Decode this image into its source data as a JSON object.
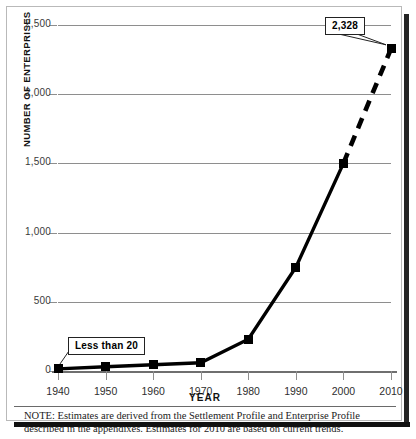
{
  "chart_data": {
    "type": "line",
    "title": "",
    "xlabel": "YEAR",
    "ylabel": "NUMBER OF ENTERPRISES",
    "x": [
      1940,
      1950,
      1960,
      1970,
      1980,
      1990,
      2000,
      2010
    ],
    "xticklabels": [
      "1940",
      "1950",
      "1960",
      "1970",
      "1980",
      "1990",
      "2000",
      "2010"
    ],
    "values": [
      15,
      30,
      45,
      60,
      230,
      750,
      1500,
      2328
    ],
    "yticks": [
      0,
      500,
      1000,
      1500,
      2000,
      2500
    ],
    "yticklabels": [
      "0",
      "500",
      "1,000",
      "1,500",
      "2,000",
      "2,500"
    ],
    "ylim": [
      0,
      2500
    ],
    "xlim": [
      1940,
      2010
    ],
    "grid": true,
    "legend": false,
    "series": [
      {
        "name": "Number of enterprises",
        "values": [
          15,
          30,
          45,
          60,
          230,
          750,
          1500,
          2328
        ],
        "solid_through": 2000,
        "dashed_from": 2000,
        "color": "#000000",
        "marker": "square"
      }
    ],
    "annotations": [
      {
        "label": "Less than 20",
        "points_to_year": 1940,
        "points_to_value": 15
      },
      {
        "label": "2,328",
        "points_to_year": 2010,
        "points_to_value": 2328
      }
    ]
  },
  "note": {
    "text": "NOTE: Estimates are derived from the Settlement Profile and Enterprise Profile described in the appendixes. Estimates for 2010 are based on current trends."
  }
}
